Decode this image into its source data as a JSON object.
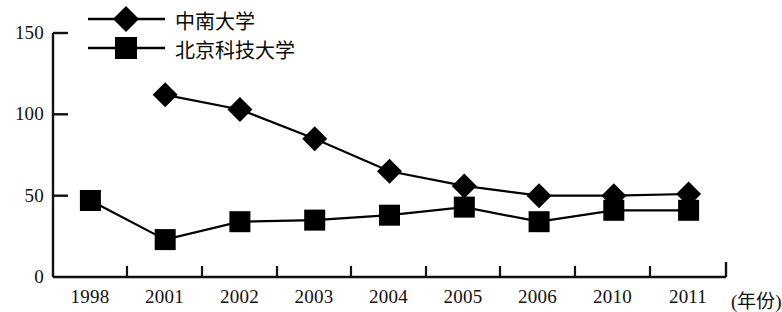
{
  "chart_data": {
    "type": "line",
    "title": "",
    "subtitle": "",
    "xlabel": "(年份)",
    "ylabel": "",
    "categories": [
      "1998",
      "2001",
      "2002",
      "2003",
      "2004",
      "2005",
      "2006",
      "2010",
      "2011"
    ],
    "series": [
      {
        "name": "中南大学",
        "marker": "diamond",
        "color": "#000000",
        "values": [
          null,
          112,
          103,
          85,
          65,
          56,
          50,
          50,
          51
        ]
      },
      {
        "name": "北京科技大学",
        "marker": "square",
        "color": "#000000",
        "values": [
          47,
          23,
          34,
          35,
          38,
          43,
          34,
          41,
          41
        ]
      }
    ],
    "ylim": [
      0,
      150
    ],
    "yticks": [
      0,
      50,
      100,
      150
    ],
    "ytick_labels": [
      "0",
      "50",
      "100",
      "150"
    ],
    "grid": false,
    "legend_position": "top-left"
  },
  "axis": {
    "y_labels": [
      "150",
      "100",
      "50",
      "0"
    ],
    "x_labels": [
      "1998",
      "2001",
      "2002",
      "2003",
      "2004",
      "2005",
      "2006",
      "2010",
      "2011"
    ],
    "x_unit": "(年份)"
  },
  "legend": {
    "entries": [
      {
        "label": "中南大学",
        "marker": "diamond"
      },
      {
        "label": "北京科技大学",
        "marker": "square"
      }
    ]
  }
}
